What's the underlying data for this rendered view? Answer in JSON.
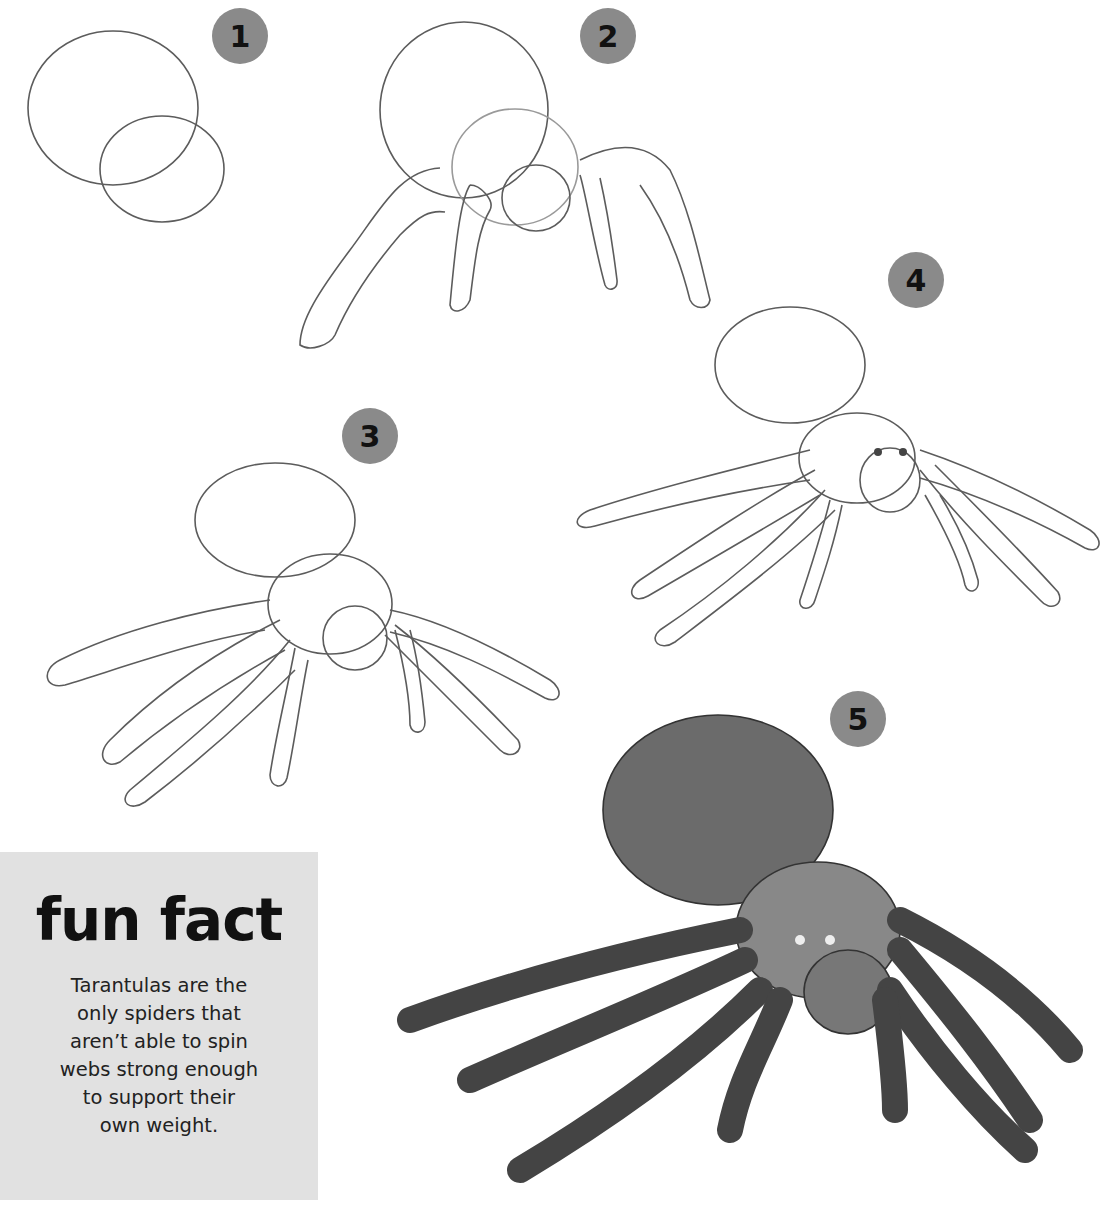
{
  "steps": [
    {
      "number": "1",
      "description": "Two overlapping circles for abdomen and cephalothorax"
    },
    {
      "number": "2",
      "description": "Add head circle and first legs"
    },
    {
      "number": "3",
      "description": "Outline of all eight legs"
    },
    {
      "number": "4",
      "description": "Add hair texture, eyes and chelicerae"
    },
    {
      "number": "5",
      "description": "Fully shaded tarantula"
    }
  ],
  "fun_fact": {
    "title": "fun fact",
    "lines": [
      "Tarantulas are the",
      "only spiders that",
      "aren’t able to spin",
      "webs strong enough",
      "to support their",
      "own weight."
    ]
  },
  "colors": {
    "badge": "#8a8a8a",
    "fact_box": "#e1e1e1",
    "pencil": "#5a5a5a"
  }
}
